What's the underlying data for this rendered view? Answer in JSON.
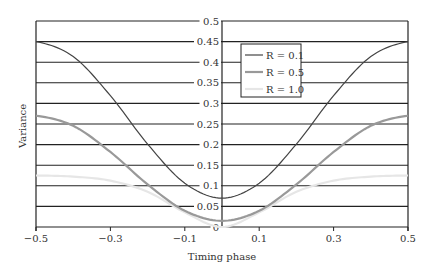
{
  "chart_data": {
    "type": "line",
    "title": "",
    "xlabel": "Timing phase",
    "ylabel": "Variance",
    "xlim": [
      -0.5,
      0.5
    ],
    "ylim": [
      0,
      0.5
    ],
    "x_ticks": [
      "-0.5",
      "-0.3",
      "-0.1",
      "0.1",
      "0.3",
      "0.5"
    ],
    "y_ticks": [
      "0",
      "0.05",
      "0.1",
      "0.15",
      "0.2",
      "0.25",
      "0.3",
      "0.35",
      "0.4",
      "0.45",
      "0.5"
    ],
    "grid": "horizontal",
    "legend_position": "upper center-right",
    "x": [
      -0.5,
      -0.4,
      -0.3,
      -0.2,
      -0.1,
      0.0,
      0.1,
      0.2,
      0.3,
      0.4,
      0.5
    ],
    "series": [
      {
        "name": "R = 0.1",
        "color": "#444444",
        "width": 1.2,
        "values": [
          0.45,
          0.4137,
          0.3188,
          0.2013,
          0.1063,
          0.07,
          0.1063,
          0.2013,
          0.3188,
          0.4137,
          0.45
        ]
      },
      {
        "name": "R = 0.5",
        "color": "#999999",
        "width": 2.2,
        "values": [
          0.27,
          0.2456,
          0.1821,
          0.1034,
          0.0394,
          0.015,
          0.0394,
          0.1034,
          0.1821,
          0.2456,
          0.27
        ]
      },
      {
        "name": "R = 1.0",
        "color": "#e6e6e6",
        "width": 2.2,
        "values": [
          0.125,
          0.1223,
          0.1125,
          0.0855,
          0.0355,
          0.0,
          0.0355,
          0.0855,
          0.1125,
          0.1223,
          0.125
        ]
      }
    ]
  }
}
